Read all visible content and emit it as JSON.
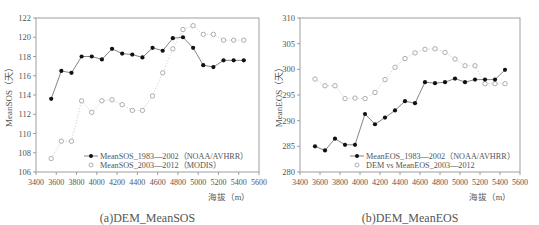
{
  "chart_data": [
    {
      "type": "line",
      "title": "(a)DEM_MeanSOS",
      "xlabel": "海拔（m）",
      "ylabel": "MeanSOS（天）",
      "xlim": [
        3400,
        5600
      ],
      "ylim": [
        106,
        122
      ],
      "xticks": [
        3400,
        3600,
        3800,
        4000,
        4200,
        4400,
        4600,
        4800,
        5000,
        5200,
        5400,
        5600
      ],
      "yticks": [
        106,
        108,
        110,
        112,
        114,
        116,
        118,
        120,
        122
      ],
      "grid": false,
      "legend_position": "lower right",
      "x": [
        3550,
        3650,
        3750,
        3850,
        3950,
        4050,
        4150,
        4250,
        4350,
        4450,
        4550,
        4650,
        4750,
        4850,
        4950,
        5050,
        5150,
        5250,
        5350,
        5450
      ],
      "series": [
        {
          "name": "MeanSOS_1983—2002（NOAA/AVHRR）",
          "marker": "filled-circle",
          "line": "solid",
          "values": [
            113.6,
            116.5,
            116.3,
            118.0,
            118.0,
            117.7,
            118.8,
            118.3,
            118.2,
            117.9,
            118.9,
            118.6,
            119.9,
            120.0,
            118.9,
            117.1,
            116.9,
            117.6,
            117.6,
            117.6
          ]
        },
        {
          "name": "MeanSOS_2003—2012（MODIS）",
          "marker": "open-circle",
          "line": "dotted",
          "values": [
            107.4,
            109.2,
            109.2,
            113.4,
            112.2,
            113.4,
            113.5,
            113.0,
            112.4,
            112.4,
            113.9,
            116.3,
            118.8,
            120.8,
            121.2,
            120.3,
            120.3,
            119.7,
            119.7,
            119.7
          ]
        }
      ]
    },
    {
      "type": "line",
      "title": "(b)DEM_MeanEOS",
      "xlabel": "海拔（m）",
      "ylabel": "MeanEOS（天）",
      "xlim": [
        3400,
        5600
      ],
      "ylim": [
        280,
        310
      ],
      "xticks": [
        3400,
        3600,
        3800,
        4000,
        4200,
        4400,
        4600,
        4800,
        5000,
        5200,
        5400,
        5600
      ],
      "yticks": [
        280,
        285,
        290,
        295,
        300,
        305,
        310
      ],
      "grid": false,
      "legend_position": "lower right",
      "x": [
        3550,
        3650,
        3750,
        3850,
        3950,
        4050,
        4150,
        4250,
        4350,
        4450,
        4550,
        4650,
        4750,
        4850,
        4950,
        5050,
        5150,
        5250,
        5350,
        5450
      ],
      "series": [
        {
          "name": "MeanEOS_1983—2002（NOAA/AVHRR）",
          "marker": "filled-circle",
          "line": "solid",
          "values": [
            285.0,
            284.2,
            286.5,
            285.3,
            285.3,
            291.3,
            289.3,
            290.6,
            292.0,
            293.8,
            293.4,
            297.5,
            297.3,
            297.5,
            298.2,
            297.5,
            298.0,
            298.0,
            298.0,
            299.9
          ]
        },
        {
          "name": "DEM vs MeanEOS_2003—2012",
          "marker": "open-circle",
          "line": "dotted",
          "values": [
            298.1,
            296.8,
            296.8,
            294.3,
            294.4,
            294.3,
            295.5,
            298.0,
            300.4,
            302.1,
            303.2,
            303.9,
            304.0,
            303.3,
            302.0,
            300.7,
            300.7,
            297.2,
            297.2,
            297.2
          ]
        }
      ]
    }
  ],
  "panels": [
    {
      "caption": "(a)DEM_MeanSOS",
      "ylabel": "MeanSOS（天）",
      "xlabel": "海拔（m）",
      "legend": [
        "MeanSOS_1983—2002（NOAA/AVHRR）",
        "MeanSOS_2003—2012（MODIS）"
      ]
    },
    {
      "caption": "(b)DEM_MeanEOS",
      "ylabel": "MeanEOS（天）",
      "xlabel": "海拔（m）",
      "legend": [
        "MeanEOS_1983—2002（NOAA/AVHRR）",
        "DEM vs MeanEOS_2003—2012"
      ]
    }
  ],
  "colors": {
    "axis": "#888888",
    "filled": "#111111",
    "open": "#999999",
    "line": "#666666",
    "dotted": "#bbbbbb"
  }
}
